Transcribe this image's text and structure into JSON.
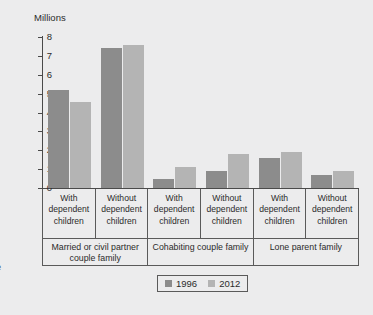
{
  "xaxis_title_clipped": "ype",
  "chart_data": {
    "type": "bar",
    "title": "",
    "subtitle": "",
    "xlabel": "Family type",
    "ylabel": "Millions",
    "ylim": [
      0,
      8
    ],
    "yticks": [
      8,
      7,
      6,
      5,
      4,
      3,
      2,
      1,
      0
    ],
    "grid": false,
    "legend_position": "bottom-center",
    "categories": [
      "With dependent children",
      "Without dependent children",
      "With dependent children",
      "Without dependent children",
      "With dependent children",
      "Without dependent children"
    ],
    "category_lines": [
      [
        "With",
        "dependent",
        "children"
      ],
      [
        "Without",
        "dependent",
        "children"
      ],
      [
        "With",
        "dependent",
        "children"
      ],
      [
        "Without",
        "dependent",
        "children"
      ],
      [
        "With",
        "dependent",
        "children"
      ],
      [
        "Without",
        "dependent",
        "children"
      ]
    ],
    "groups": [
      {
        "label": "Married or civil partner couple family",
        "span": 2
      },
      {
        "label": "Cohabiting couple family",
        "span": 2
      },
      {
        "label": "Lone parent family",
        "span": 2
      }
    ],
    "series": [
      {
        "name": "1996",
        "color": "#8c8c8c",
        "values": [
          5.2,
          7.4,
          0.5,
          0.9,
          1.6,
          0.7
        ]
      },
      {
        "name": "2012",
        "color": "#b4b4b4",
        "values": [
          4.55,
          7.6,
          1.1,
          1.8,
          1.9,
          0.9
        ]
      }
    ]
  },
  "legend": {
    "items": [
      {
        "label": "1996",
        "color": "#8c8c8c"
      },
      {
        "label": "2012",
        "color": "#b4b4b4"
      }
    ]
  }
}
